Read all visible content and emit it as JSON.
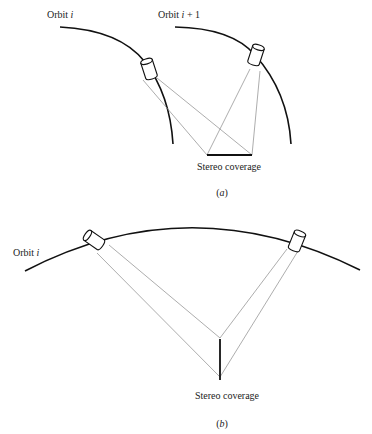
{
  "figure_a": {
    "orbit_left_label": "Orbit ",
    "orbit_left_var": "i",
    "orbit_right_label": "Orbit ",
    "orbit_right_var": "i",
    "orbit_right_suffix": " + 1",
    "coverage_label": "Stereo coverage",
    "caption_open": "(",
    "caption_letter": "a",
    "caption_close": ")"
  },
  "figure_b": {
    "orbit_label": "Orbit ",
    "orbit_var": "i",
    "coverage_label": "Stereo coverage",
    "caption_open": "(",
    "caption_letter": "b",
    "caption_close": ")"
  },
  "colors": {
    "line": "#111111",
    "ray": "#8a8a8a",
    "background": "#ffffff"
  }
}
